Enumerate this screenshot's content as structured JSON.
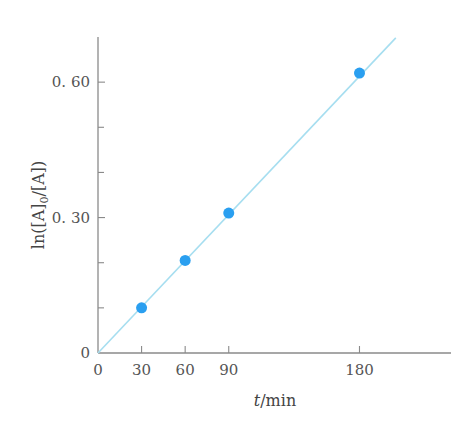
{
  "chart_data": {
    "type": "scatter",
    "title": "",
    "xlabel_italic": "t",
    "xlabel_rest": "/min",
    "ylabel": "ln([A]",
    "ylabel_sub": "0",
    "ylabel_rest": "/[A])",
    "xlim": [
      0,
      243
    ],
    "ylim": [
      0,
      0.7
    ],
    "x_ticks": [
      0,
      30,
      60,
      90,
      180
    ],
    "x_tick_labels": [
      "0",
      "30",
      "60",
      "90",
      "180"
    ],
    "y_ticks_major": [
      0,
      0.3,
      0.6
    ],
    "y_tick_labels": [
      "0",
      "0. 30",
      "0. 60"
    ],
    "y_ticks_minor": [
      0.1,
      0.2,
      0.4,
      0.5
    ],
    "grid": false,
    "series": [
      {
        "name": "data",
        "x": [
          30,
          60,
          90,
          180
        ],
        "y": [
          0.1,
          0.205,
          0.31,
          0.62
        ],
        "color": "#2a9ff0"
      }
    ],
    "fit_line": {
      "name": "linear fit through origin",
      "x": [
        0,
        205
      ],
      "y": [
        0,
        0.698
      ],
      "color": "#a6def0"
    }
  }
}
